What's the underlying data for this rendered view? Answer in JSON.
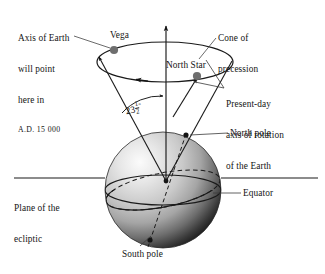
{
  "diagram": {
    "labels": {
      "axis_future_line1": "Axis of Earth",
      "axis_future_line2": "will point",
      "axis_future_line3": "here in",
      "axis_future_line4": "A.D. 15 000",
      "vega": "Vega",
      "cone_line1": "Cone of",
      "cone_line2": "precession",
      "north_star": "North Star",
      "present_day_line1": "Present-day",
      "present_day_line2": "axis of rotation",
      "present_day_line3": "of the Earth",
      "north_pole": "North pole",
      "equator": "Equator",
      "ecliptic_line1": "Plane of the",
      "ecliptic_line2": "ecliptic",
      "south_pole": "South pole",
      "tilt_angle_whole": "23",
      "tilt_angle_numerator": "1",
      "tilt_angle_denominator": "2",
      "tilt_angle_unit": "°"
    },
    "colors": {
      "ink": "#141414",
      "line": "#1a1a1a",
      "star_dot": "#6e6e6e",
      "earth_light": "#f2f2f2",
      "earth_mid": "#b9b9b9",
      "earth_dark": "#2a2a2a",
      "background": "#ffffff"
    },
    "geometry": {
      "earth_center_x": 163,
      "earth_center_y": 190,
      "earth_radius": 58,
      "precession_circle_cx": 163,
      "precession_circle_cy": 62,
      "precession_circle_rx": 72,
      "precession_circle_ry": 20,
      "vega_x": 114,
      "vega_y": 49,
      "north_star_x": 198,
      "north_star_y": 74,
      "tilt_degrees": 23.5
    }
  }
}
